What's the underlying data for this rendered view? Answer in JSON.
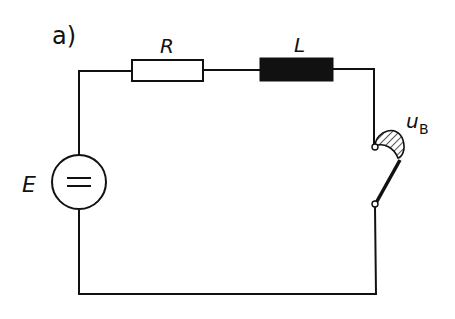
{
  "figure": {
    "panel_label": "a)",
    "components": {
      "resistor": {
        "label": "R",
        "type": "resistor"
      },
      "inductor": {
        "label": "L",
        "type": "inductor"
      },
      "source": {
        "label": "E",
        "type": "dc-voltage-source",
        "symbol": "="
      },
      "switch": {
        "label_main": "u",
        "label_sub": "B",
        "type": "switch-with-arc"
      }
    },
    "colors": {
      "line": "#111111",
      "background": "#ffffff"
    }
  }
}
